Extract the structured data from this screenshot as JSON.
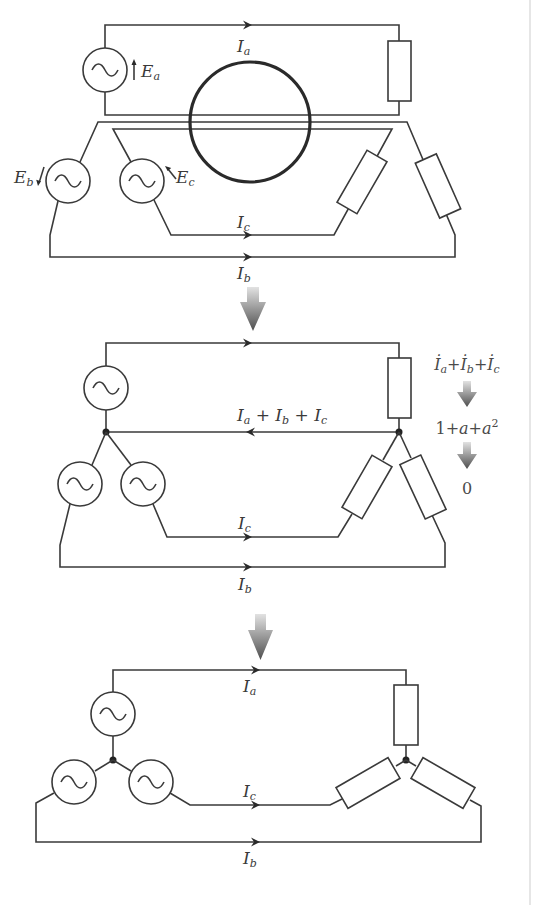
{
  "diagram": {
    "colors": {
      "wire": "#3a3a3a",
      "transform_arrow_top": "#d8d8d8",
      "transform_arrow_bottom": "#555555",
      "border": "#e6e6e6"
    },
    "panel_1": {
      "description": "Three independent single-phase circuits with a magnetic core loop",
      "sources": [
        {
          "id": "a",
          "emf_label": "E",
          "emf_sub": "a"
        },
        {
          "id": "b",
          "emf_label": "E",
          "emf_sub": "b"
        },
        {
          "id": "c",
          "emf_label": "E",
          "emf_sub": "c"
        }
      ],
      "currents": [
        {
          "label": "I",
          "sub": "a"
        },
        {
          "label": "I",
          "sub": "c"
        },
        {
          "label": "I",
          "sub": "b"
        }
      ]
    },
    "panel_2": {
      "description": "Common return wire combining all three currents",
      "return_current": {
        "parts": [
          {
            "label": "I",
            "sub": "a"
          },
          {
            "op": "+"
          },
          {
            "label": "I",
            "sub": "b"
          },
          {
            "op": "+"
          },
          {
            "label": "I",
            "sub": "c"
          }
        ]
      },
      "currents": [
        {
          "label": "I",
          "sub": "c"
        },
        {
          "label": "I",
          "sub": "b"
        }
      ],
      "derivation": {
        "step_1": {
          "parts": [
            "İ",
            "a",
            "+",
            "İ",
            "b",
            "+",
            "İ",
            "c"
          ]
        },
        "step_2": {
          "one": "1",
          "plus1": "+",
          "a": "a",
          "plus2": "+",
          "a2": "a",
          "exp": "2"
        },
        "step_3": "0"
      }
    },
    "panel_3": {
      "description": "Star (Y) connection with neutral wire removed",
      "currents": [
        {
          "label": "I",
          "sub": "a"
        },
        {
          "label": "I",
          "sub": "c"
        },
        {
          "label": "I",
          "sub": "b"
        }
      ]
    }
  }
}
